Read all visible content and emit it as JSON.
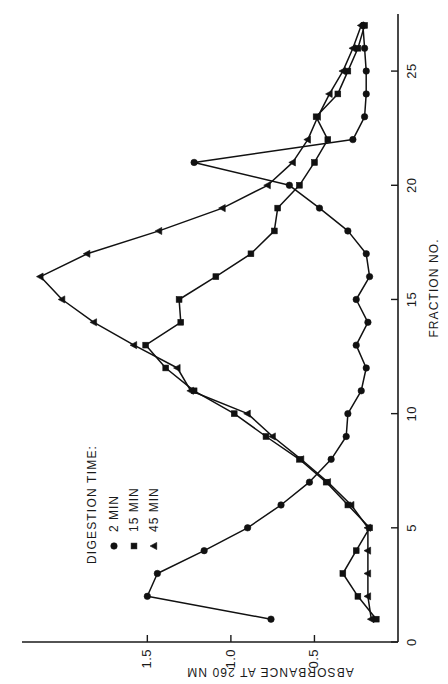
{
  "chart_data": {
    "type": "line",
    "title": "",
    "xlabel": "FRACTION NO.",
    "ylabel": "ABSORBANCE AT 260 NM",
    "xlim": [
      0,
      27.5
    ],
    "ylim": [
      0,
      2.25
    ],
    "xticks": [
      0,
      5,
      10,
      15,
      20,
      25
    ],
    "xticklabels": [
      "0",
      "5",
      "10",
      "15",
      "20",
      "25"
    ],
    "yticks": [
      0.5,
      1.0,
      1.5
    ],
    "yticklabels": [
      "0.5",
      "1.0",
      "1.5"
    ],
    "grid": false,
    "legend_position": "upper-left",
    "legend_title": "DIGESTION TIME:",
    "series": [
      {
        "name": "2 MIN",
        "marker": "circle",
        "x": [
          1,
          2,
          3,
          4,
          5,
          6,
          7,
          8,
          9,
          10,
          11,
          12,
          13,
          14,
          15,
          16,
          17,
          18,
          19,
          20,
          21,
          22,
          23,
          24,
          25,
          26,
          27
        ],
        "y": [
          0.76,
          1.5,
          1.44,
          1.16,
          0.9,
          0.7,
          0.53,
          0.4,
          0.31,
          0.3,
          0.22,
          0.19,
          0.25,
          0.18,
          0.25,
          0.17,
          0.19,
          0.3,
          0.47,
          0.65,
          1.22,
          0.27,
          0.2,
          0.19,
          0.19,
          0.2,
          0.21
        ]
      },
      {
        "name": "15 MIN",
        "marker": "square",
        "x": [
          1,
          2,
          3,
          4,
          5,
          6,
          7,
          8,
          9,
          10,
          11,
          12,
          13,
          14,
          15,
          16,
          17,
          18,
          19,
          20,
          21,
          22,
          23,
          24,
          25,
          26,
          27
        ],
        "y": [
          0.13,
          0.24,
          0.33,
          0.25,
          0.17,
          0.3,
          0.43,
          0.59,
          0.79,
          0.98,
          1.22,
          1.39,
          1.51,
          1.3,
          1.31,
          1.09,
          0.88,
          0.74,
          0.72,
          0.59,
          0.5,
          0.42,
          0.49,
          0.36,
          0.3,
          0.24,
          0.2
        ]
      },
      {
        "name": "45 MIN",
        "marker": "triangle",
        "x": [
          1,
          2,
          3,
          4,
          5,
          6,
          7,
          8,
          9,
          10,
          11,
          12,
          13,
          14,
          15,
          16,
          17,
          18,
          19,
          20,
          21,
          22,
          23,
          24,
          25,
          26,
          27
        ],
        "y": [
          0.16,
          0.18,
          0.18,
          0.18,
          0.18,
          0.28,
          0.42,
          0.58,
          0.75,
          0.9,
          1.24,
          1.32,
          1.58,
          1.82,
          2.01,
          2.14,
          1.86,
          1.43,
          1.05,
          0.78,
          0.63,
          0.54,
          0.48,
          0.41,
          0.33,
          0.27,
          0.22
        ]
      }
    ]
  },
  "legend": {
    "title": "DIGESTION TIME:",
    "items": [
      {
        "label": "2 MIN",
        "marker": "circle"
      },
      {
        "label": "15 MIN",
        "marker": "square"
      },
      {
        "label": "45 MIN",
        "marker": "triangle"
      }
    ]
  }
}
